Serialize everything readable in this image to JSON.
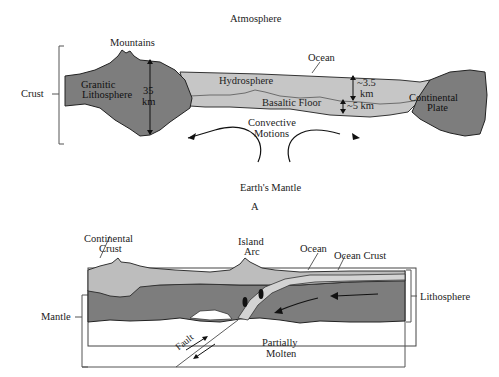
{
  "diagram_a": {
    "caption": "A",
    "labels": {
      "atmosphere": "Atmosphere",
      "mountains": "Mountains",
      "ocean": "Ocean",
      "crust": "Crust",
      "granitic_1": "Granitic",
      "granitic_2": "Lithosphere",
      "thick_1": "35",
      "thick_2": "km",
      "hydrosphere": "Hydrosphere",
      "depth_ocean_1": "~3.5",
      "depth_ocean_2": "km",
      "basaltic_floor": "Basaltic Floor",
      "depth_floor": "~5 km",
      "continental_1": "Continental",
      "continental_2": "Plate",
      "convective_1": "Convective",
      "convective_2": "Motions",
      "mantle": "Earth's Mantle"
    }
  },
  "diagram_b": {
    "labels": {
      "continental_1": "Continental",
      "continental_2": "Crust",
      "island_1": "Island",
      "island_2": "Arc",
      "ocean": "Ocean",
      "ocean_crust": "Ocean Crust",
      "lithosphere": "Lithosphere",
      "mantle": "Mantle",
      "fault": "Fault",
      "partially_1": "Partially",
      "partially_2": "Molten"
    }
  },
  "colors": {
    "dark_rock": "#7a7a7a",
    "light_rock": "#bdbdbd",
    "ocean_crust": "#d0d0d0",
    "line": "#222222"
  }
}
